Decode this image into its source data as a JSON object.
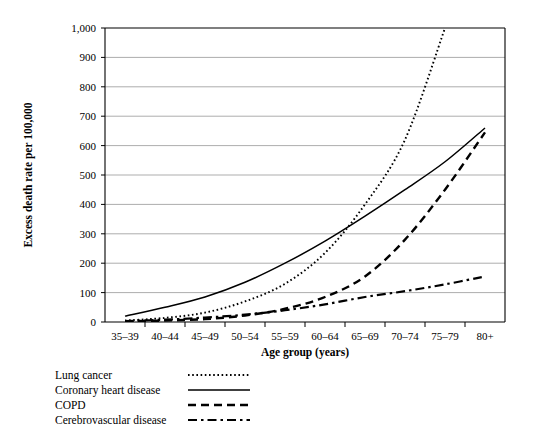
{
  "chart_data": {
    "type": "line",
    "title": "",
    "xlabel": "Age group (years)",
    "ylabel": "Excess death rate per 100,000",
    "categories": [
      "35–39",
      "40–44",
      "45–49",
      "50–54",
      "55–59",
      "60–64",
      "65–69",
      "70–74",
      "75–79",
      "80+"
    ],
    "ylim": [
      0,
      1000
    ],
    "yticks": [
      0,
      100,
      200,
      300,
      400,
      500,
      600,
      700,
      800,
      900,
      1000
    ],
    "ytick_labels": [
      "0",
      "100",
      "200",
      "300",
      "400",
      "500",
      "600",
      "700",
      "800",
      "900",
      "1,000"
    ],
    "grid": true,
    "legend_position": "below-left",
    "series": [
      {
        "name": "Lung cancer",
        "style": "dotted",
        "values": [
          5,
          14,
          32,
          70,
          130,
          235,
          400,
          620,
          1000,
          null
        ],
        "clipped_at_top": true
      },
      {
        "name": "Coronary heart disease",
        "style": "solid",
        "values": [
          20,
          50,
          85,
          135,
          200,
          275,
          360,
          450,
          545,
          660
        ]
      },
      {
        "name": "COPD",
        "style": "dashed",
        "values": [
          2,
          5,
          10,
          22,
          45,
          85,
          155,
          280,
          450,
          645
        ]
      },
      {
        "name": "Cerebrovascular disease",
        "style": "dash-dot",
        "values": [
          3,
          8,
          15,
          25,
          40,
          60,
          85,
          105,
          128,
          155
        ]
      }
    ]
  },
  "legend": {
    "items": [
      {
        "label": "Lung cancer",
        "style": "dotted"
      },
      {
        "label": "Coronary heart disease",
        "style": "solid"
      },
      {
        "label": "COPD",
        "style": "dashed"
      },
      {
        "label": "Cerebrovascular disease",
        "style": "dash-dot"
      }
    ]
  }
}
